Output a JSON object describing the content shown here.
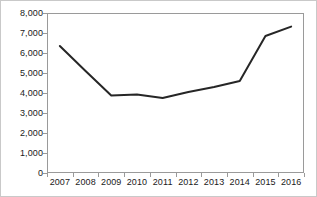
{
  "chart_data": {
    "type": "line",
    "title": "",
    "subtitle": "",
    "xlabel": "",
    "ylabel": "",
    "categories": [
      "2007",
      "2008",
      "2009",
      "2010",
      "2011",
      "2012",
      "2013",
      "2014",
      "2015",
      "2016"
    ],
    "x": [
      2007,
      2008,
      2009,
      2010,
      2011,
      2012,
      2013,
      2014,
      2015,
      2016
    ],
    "series": [
      {
        "name": "",
        "values": [
          6350,
          5100,
          3880,
          3920,
          3750,
          4050,
          4300,
          4600,
          6850,
          7320
        ],
        "color": "#262626",
        "line_width": 2,
        "markers": "none"
      }
    ],
    "ylim": [
      0,
      8000
    ],
    "ytick_values": [
      0,
      1000,
      2000,
      3000,
      4000,
      5000,
      6000,
      7000,
      8000
    ],
    "ytick_labels": [
      "0",
      "1,000",
      "2,000",
      "3,000",
      "4,000",
      "5,000",
      "6,000",
      "7,000",
      "8,000"
    ],
    "xtick_labels": [
      "2007",
      "2008",
      "2009",
      "2010",
      "2011",
      "2012",
      "2013",
      "2014",
      "2015",
      "2016"
    ],
    "grid": false,
    "legend": "none",
    "frame": "box",
    "annotations": []
  },
  "colors": {
    "line": "#262626",
    "axis": "#9a9a9a",
    "text": "#1a1a1a",
    "outer_border": "#c9c9c9",
    "background": "#ffffff"
  }
}
